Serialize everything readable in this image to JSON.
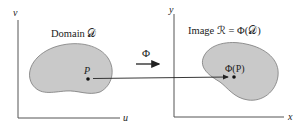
{
  "diagram": {
    "left_panel": {
      "title": "Domain 𝒟",
      "x_axis_label": "u",
      "y_axis_label": "v",
      "point_label": "P"
    },
    "right_panel": {
      "title": "Image ℛ = Φ(𝒟)",
      "x_axis_label": "x",
      "y_axis_label": "y",
      "point_label": "Φ(P)"
    },
    "map_label": "Φ",
    "colors": {
      "region_fill": "#c9c9c9",
      "region_stroke": "#7a7a7a",
      "axis": "#555555",
      "text": "#222222"
    }
  }
}
